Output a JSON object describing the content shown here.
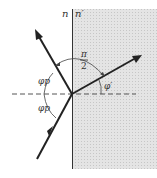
{
  "diagram": {
    "labels": {
      "medium_left": "n",
      "medium_right": "n′",
      "angle_between": "π",
      "angle_between_den": "2",
      "incident_angle_upper": "φp",
      "incident_angle_lower": "φp",
      "refracted_angle": "φ′"
    },
    "colors": {
      "line": "#222222",
      "shade": "#d9d9d9",
      "dash": "#555555"
    }
  }
}
